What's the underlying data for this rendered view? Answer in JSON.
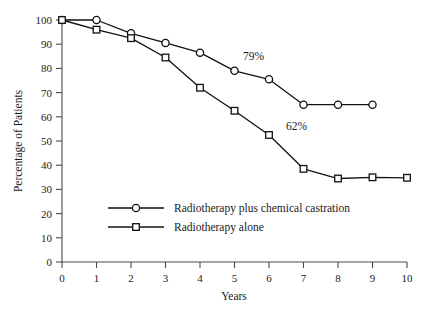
{
  "chart_data": {
    "type": "line",
    "title": "",
    "xlabel": "Years",
    "ylabel": "Percentage of Patients",
    "xlim": [
      0,
      10
    ],
    "ylim": [
      0,
      100
    ],
    "grid": false,
    "x": [
      0,
      1,
      2,
      3,
      4,
      5,
      6,
      7,
      8,
      9,
      10
    ],
    "xticks": [
      "0",
      "1",
      "2",
      "3",
      "4",
      "5",
      "6",
      "7",
      "8",
      "9",
      "10"
    ],
    "yticks": [
      "0",
      "10",
      "20",
      "30",
      "40",
      "50",
      "60",
      "70",
      "80",
      "90",
      "100"
    ],
    "legend_position": "inside-lower-left",
    "series": [
      {
        "name": "Radiotherapy plus chemical castration",
        "marker": "circle",
        "x": [
          0,
          1,
          2,
          3,
          4,
          5,
          6,
          7,
          8,
          9
        ],
        "values": [
          100,
          100,
          94.5,
          90.5,
          86.5,
          79,
          75.5,
          65,
          65,
          65
        ]
      },
      {
        "name": "Radiotherapy alone",
        "marker": "square",
        "x": [
          0,
          1,
          2,
          3,
          4,
          5,
          6,
          7,
          8,
          9,
          10
        ],
        "values": [
          100,
          96,
          92.5,
          84.5,
          72,
          62.5,
          52.5,
          38.5,
          34.5,
          35,
          34.8
        ]
      }
    ],
    "annotations": [
      {
        "text": "79%",
        "x": 5.55,
        "y": 83.5
      },
      {
        "text": "62%",
        "x": 6.8,
        "y": 54.5
      }
    ]
  }
}
